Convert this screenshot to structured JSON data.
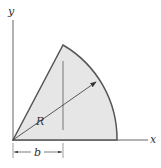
{
  "diagram": {
    "axes": {
      "x_label": "x",
      "y_label": "y"
    },
    "labels": {
      "radius": "R",
      "dimension": "b"
    },
    "colors": {
      "fill": "#e6e6e6",
      "outline": "#555555",
      "axis": "#666666",
      "text": "#333333"
    }
  }
}
